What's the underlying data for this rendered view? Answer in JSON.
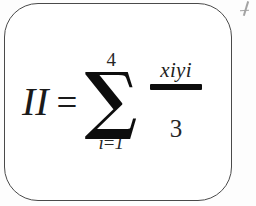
{
  "document": {
    "type": "scanned-math-formula",
    "background_color": "#fdfdfd"
  },
  "formula_box": {
    "border_color": "#4a4a4a",
    "fill_color": "#ffffff",
    "corner_radius_px": 34
  },
  "formula": {
    "left_hand_side": "II",
    "equals_sign": "=",
    "summation_symbol": "∑",
    "upper_limit": "4",
    "lower_limit_variable": "i",
    "lower_limit_equals": "=",
    "lower_limit_value": "1",
    "lower_limit_full": "i = 1",
    "numerator": "xiyi",
    "denominator": "3",
    "plain_text": "II = ∑(i=1 to 4) xiyi / 3",
    "text_color": "#1a1a1a",
    "fraction_bar_color": "#0d0d0d"
  },
  "artifacts": {
    "stray_mark_description": "partial ink glyph fragment at top-right edge"
  }
}
